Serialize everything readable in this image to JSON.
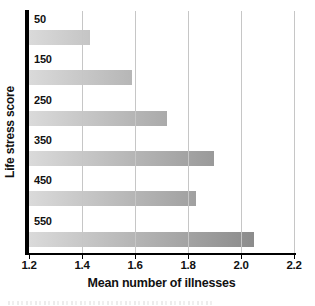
{
  "chart_data": {
    "type": "bar",
    "orientation": "horizontal",
    "categories": [
      "50",
      "150",
      "250",
      "350",
      "450",
      "550"
    ],
    "values": [
      1.43,
      1.59,
      1.72,
      1.9,
      1.83,
      2.05
    ],
    "xlabel": "Mean number of illnesses",
    "ylabel": "Life stress score",
    "xlim": [
      1.2,
      2.2
    ],
    "xticks": [
      1.2,
      1.4,
      1.6,
      1.8,
      2.0,
      2.2
    ],
    "xtick_labels": [
      "1.2",
      "1.4",
      "1.6",
      "1.8",
      "2.0",
      "2.2"
    ],
    "grid": true,
    "legend": false,
    "colors": {
      "bar_gradient_start": "#dadada",
      "bar_gradient_end": "#7e7e7e",
      "gridline": "#c6c6c6",
      "axis": "#000000",
      "text": "#111111",
      "background": "#ffffff"
    }
  }
}
